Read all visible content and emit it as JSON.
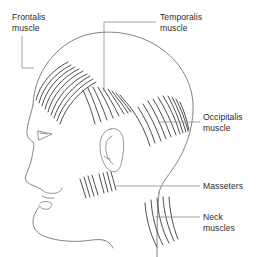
{
  "figure": {
    "background_color": "#ffffff",
    "outline_color": "#6b6b6b",
    "hatch_color": "#3a3a3a",
    "leader_color": "#8d8d8d",
    "text_color": "#2b2b2b"
  },
  "labels": {
    "frontalis": "Frontalis\nmuscle",
    "temporalis": "Temporalis\nmuscle",
    "occipitalis": "Occipitalis\nmuscle",
    "masseters": "Masseters",
    "neck": "Neck\nmuscles"
  },
  "muscle_groups": [
    {
      "name": "frontalis",
      "label": "Frontalis muscle",
      "stroke_count": 9,
      "region": "forehead",
      "leader": "down-right from label to forehead"
    },
    {
      "name": "temporalis",
      "label": "Temporalis muscle",
      "stroke_count": 9,
      "region": "temple above ear",
      "leader": "left then down from label to temple"
    },
    {
      "name": "occipitalis",
      "label": "Occipitalis muscle",
      "stroke_count": 11,
      "region": "back of skull",
      "leader": "left from label to occiput"
    },
    {
      "name": "masseters",
      "label": "Masseters",
      "stroke_count": 8,
      "region": "jaw below ear",
      "leader": "left from label to jaw"
    },
    {
      "name": "neck",
      "label": "Neck muscles",
      "stroke_count": 5,
      "region": "posterior neck",
      "leader": "left from label to neck"
    }
  ]
}
